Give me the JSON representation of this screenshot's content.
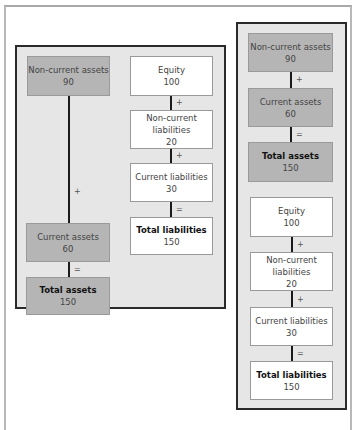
{
  "diagram": {
    "colors": {
      "panel_bg": "#e6e6e6",
      "asset_box": "#b5b5b5",
      "liability_box": "#ffffff",
      "border": "#2a2a2a"
    },
    "horizontal_layout": {
      "assets": {
        "non_current": {
          "label": "Non-current assets",
          "value": "90"
        },
        "op1": "+",
        "current": {
          "label": "Current assets",
          "value": "60"
        },
        "op2": "=",
        "total": {
          "label": "Total assets",
          "value": "150"
        }
      },
      "liabilities": {
        "equity": {
          "label": "Equity",
          "value": "100"
        },
        "op1": "+",
        "non_current": {
          "label": "Non-current liabilities",
          "value": "20"
        },
        "op2": "+",
        "current": {
          "label": "Current liabilities",
          "value": "30"
        },
        "op3": "=",
        "total": {
          "label": "Total liabilities",
          "value": "150"
        }
      }
    },
    "vertical_layout": {
      "assets": {
        "non_current": {
          "label": "Non-current assets",
          "value": "90"
        },
        "op1": "+",
        "current": {
          "label": "Current assets",
          "value": "60"
        },
        "op2": "=",
        "total": {
          "label": "Total assets",
          "value": "150"
        }
      },
      "liabilities": {
        "equity": {
          "label": "Equity",
          "value": "100"
        },
        "op1": "+",
        "non_current": {
          "label": "Non-current liabilities",
          "value": "20"
        },
        "op2": "+",
        "current": {
          "label": "Current liabilities",
          "value": "30"
        },
        "op3": "=",
        "total": {
          "label": "Total liabilities",
          "value": "150"
        }
      }
    }
  }
}
